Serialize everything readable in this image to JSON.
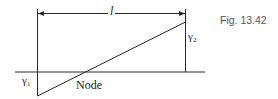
{
  "figure": {
    "caption": "Fig. 13.42",
    "dimension_label": "l",
    "left_label": "γ",
    "left_label_sub": "1",
    "right_label": "γ",
    "right_label_sub": "2",
    "node_label": "Node"
  },
  "colors": {
    "line": "#2a2a2a",
    "caption": "#555555",
    "background": "#ffffff"
  }
}
